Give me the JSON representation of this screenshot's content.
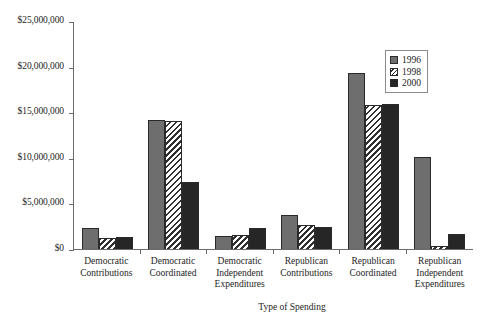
{
  "chart_data": {
    "type": "bar",
    "title": "",
    "xlabel": "Type of Spending",
    "ylabel": "",
    "ylim": [
      0,
      25000000
    ],
    "yticks": [
      0,
      5000000,
      10000000,
      15000000,
      20000000,
      25000000
    ],
    "ytick_labels": [
      "$0",
      "$5,000,000",
      "$10,000,000",
      "$15,000,000",
      "$20,000,000",
      "$25,000,000"
    ],
    "grid": false,
    "legend_position": "top-right",
    "categories": [
      "Democratic Contributions",
      "Democratic Coordinated",
      "Democratic Independent Expenditures",
      "Republican Contributions",
      "Republican Coordinated",
      "Republican Independent Expenditures"
    ],
    "category_lines": [
      [
        "Democratic",
        "Contributions"
      ],
      [
        "Democratic",
        "Coordinated"
      ],
      [
        "Democratic",
        "Independent",
        "Expenditures"
      ],
      [
        "Republican",
        "Contributions"
      ],
      [
        "Republican",
        "Coordinated"
      ],
      [
        "Republican",
        "Independent",
        "Expenditures"
      ]
    ],
    "series": [
      {
        "name": "1996",
        "color": "#6e6e6e",
        "pattern": "solid-gray",
        "values": [
          2300000,
          14100000,
          1400000,
          3700000,
          19300000,
          10050000
        ]
      },
      {
        "name": "1998",
        "color": "#2f2f2f",
        "pattern": "diagonal-hatch",
        "values": [
          1200000,
          14050000,
          1500000,
          2600000,
          15750000,
          300000
        ]
      },
      {
        "name": "2000",
        "color": "#262626",
        "pattern": "solid-black",
        "values": [
          1350000,
          7350000,
          2350000,
          2400000,
          15850000,
          1600000
        ]
      }
    ]
  },
  "legend": {
    "items": [
      {
        "label": "1996"
      },
      {
        "label": "1998"
      },
      {
        "label": "2000"
      }
    ]
  }
}
